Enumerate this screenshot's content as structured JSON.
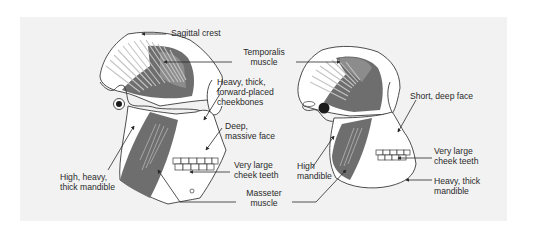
{
  "figure": {
    "background": "#f2f2f2",
    "colors": {
      "outline": "#3a3a3a",
      "bone": "#ffffff",
      "muscle_dark": "#6e6e6e",
      "muscle_mid": "#8c8c8c",
      "muscle_fibers": "#b9b9b9",
      "label_text": "#2a2a2a"
    },
    "left_skull": {
      "labels": {
        "sagittal_crest": "Sagittal crest",
        "cheekbones": [
          "Heavy, thick,",
          "forward-placed",
          "cheekbones"
        ],
        "face": [
          "Deep,",
          "massive face"
        ],
        "cheek_teeth": [
          "Very large",
          "cheek teeth"
        ],
        "mandible": [
          "High, heavy,",
          "thick mandible"
        ]
      }
    },
    "shared_labels": {
      "temporalis": [
        "Temporalis",
        "muscle"
      ],
      "masseter": [
        "Masseter",
        "muscle"
      ]
    },
    "right_skull": {
      "labels": {
        "face": "Short, deep face",
        "high_mandible": [
          "High",
          "mandible"
        ],
        "cheek_teeth": [
          "Very large",
          "cheek teeth"
        ],
        "mandible": [
          "Heavy, thick",
          "mandible"
        ]
      }
    }
  }
}
